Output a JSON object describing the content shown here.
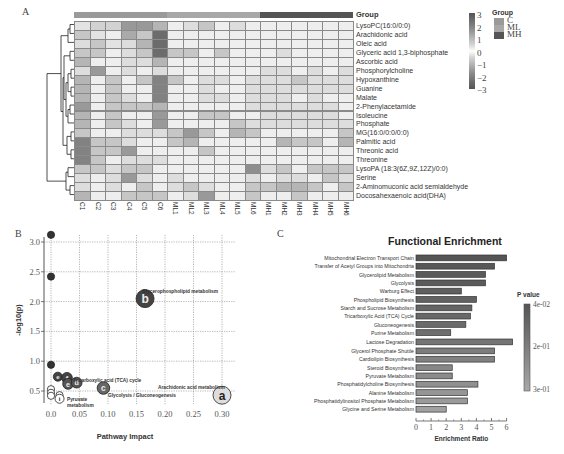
{
  "panels": {
    "a_label": "A",
    "b_label": "B",
    "c_label": "C"
  },
  "heatmap": {
    "group_header": "Group",
    "columns": [
      "C1",
      "C2",
      "C3",
      "C4",
      "C5",
      "C6",
      "ML1",
      "ML2",
      "ML3",
      "ML4",
      "ML5",
      "ML6",
      "MH1",
      "MH2",
      "MH3",
      "MH4",
      "MH5",
      "MH6"
    ],
    "column_groups": [
      "C",
      "C",
      "C",
      "C",
      "C",
      "C",
      "ML",
      "ML",
      "ML",
      "ML",
      "ML",
      "ML",
      "MH",
      "MH",
      "MH",
      "MH",
      "MH",
      "MH"
    ],
    "rows": [
      "LysoPC(16:0/0:0)",
      "Arachidonic acid",
      "Oleic acid",
      "Glyceric acid 1,3-biphosphate",
      "Ascorbic acid",
      "Phosphorylcholine",
      "Hypoxanthine",
      "Guanine",
      "Malate",
      "2-Phenylacetamide",
      "Isoleucine",
      "Phosphate",
      "MG(16:0/0:0/0:0)",
      "Palmitic acid",
      "Threonic acid",
      "Threonine",
      "LysoPA (18:3(6Z,9Z,12Z)/0:0)",
      "Serine",
      "2-Aminomuconic acid semialdehyde",
      "Docosahexaenoic acid(DHA)"
    ],
    "values": [
      [
        0.5,
        -0.8,
        -0.8,
        -1.8,
        -1.8,
        -1.3,
        0.3,
        -0.6,
        1.0,
        0.3,
        -0.6,
        0.3,
        0.3,
        0.3,
        0.3,
        0.3,
        0.3,
        0.3
      ],
      [
        1.0,
        0.5,
        -0.3,
        -1.5,
        -1.0,
        -2.6,
        0.3,
        0.3,
        0.3,
        0.3,
        0.3,
        0.3,
        0.3,
        0.3,
        0.3,
        0.3,
        0.3,
        0.3
      ],
      [
        -0.6,
        1.0,
        0.5,
        -0.6,
        -1.3,
        -2.6,
        0.3,
        0.3,
        0.3,
        0.3,
        0.3,
        0.3,
        0.3,
        0.3,
        0.3,
        0.3,
        0.3,
        0.3
      ],
      [
        -1.0,
        1.0,
        0.3,
        -0.6,
        -1.0,
        -2.6,
        1.0,
        1.0,
        0.3,
        1.0,
        0.3,
        0.3,
        0.3,
        -0.6,
        0.3,
        -0.3,
        0.3,
        0.3
      ],
      [
        -1.3,
        -0.3,
        0.3,
        -0.6,
        -0.6,
        -1.3,
        0.3,
        0.3,
        0.3,
        0.3,
        0.3,
        0.3,
        0.3,
        0.3,
        0.3,
        0.3,
        0.3,
        0.3
      ],
      [
        -0.6,
        -1.8,
        0.3,
        -0.6,
        0.3,
        -0.6,
        0.3,
        -0.3,
        0.3,
        0.3,
        -0.3,
        0.3,
        -0.6,
        -0.6,
        0.3,
        -0.6,
        -0.3,
        -0.6
      ],
      [
        -1.3,
        -0.3,
        1.0,
        -0.3,
        1.0,
        -2.2,
        1.0,
        -0.3,
        -0.6,
        -0.6,
        -0.3,
        -0.6,
        -0.6,
        -0.6,
        1.0,
        -0.6,
        -0.6,
        -0.6
      ],
      [
        -1.3,
        -0.3,
        1.0,
        -0.3,
        0.3,
        -2.2,
        0.3,
        -0.3,
        -0.6,
        0.3,
        0.3,
        -0.6,
        -0.6,
        -0.6,
        -0.6,
        -0.6,
        -0.6,
        -0.6
      ],
      [
        -1.3,
        -0.3,
        1.0,
        -0.6,
        0.3,
        -2.2,
        0.3,
        0.3,
        -0.6,
        -0.6,
        0.3,
        -0.6,
        -0.6,
        -0.6,
        0.3,
        -0.6,
        -0.3,
        -0.3
      ],
      [
        -1.8,
        0.3,
        1.0,
        -1.0,
        1.0,
        -1.3,
        0.3,
        0.3,
        0.3,
        0.3,
        0.3,
        -0.6,
        -0.6,
        -0.6,
        -0.6,
        -0.6,
        -0.6,
        0.3
      ],
      [
        -1.3,
        0.3,
        1.0,
        -0.3,
        0.3,
        -1.8,
        0.3,
        0.3,
        1.0,
        1.0,
        0.3,
        -0.3,
        -0.6,
        -0.6,
        -0.6,
        -0.6,
        -0.6,
        -0.3
      ],
      [
        -1.3,
        0.3,
        1.0,
        -0.6,
        -0.3,
        -1.8,
        0.3,
        0.3,
        0.3,
        0.3,
        1.0,
        -0.6,
        -0.6,
        -0.6,
        -0.6,
        -0.6,
        -0.6,
        -0.6
      ],
      [
        -1.0,
        0.3,
        0.3,
        -0.6,
        -0.6,
        -0.6,
        1.0,
        -1.8,
        1.0,
        0.3,
        -1.3,
        1.0,
        0.3,
        0.3,
        0.3,
        0.3,
        -0.3,
        1.0
      ],
      [
        -2.2,
        1.0,
        1.0,
        -0.6,
        0.3,
        -0.3,
        1.0,
        -1.3,
        0.3,
        0.3,
        0.3,
        0.3,
        -0.3,
        -1.3,
        1.0,
        1.0,
        0.3,
        -1.3
      ],
      [
        -2.2,
        1.0,
        1.0,
        -1.8,
        0.3,
        0.3,
        0.3,
        0.3,
        1.0,
        0.3,
        0.3,
        0.3,
        -0.3,
        0.3,
        0.3,
        0.3,
        0.3,
        0.3
      ],
      [
        -2.2,
        1.0,
        0.3,
        -0.6,
        -0.6,
        -0.6,
        0.3,
        0.3,
        0.3,
        0.3,
        0.3,
        0.3,
        0.3,
        0.3,
        0.3,
        -0.3,
        0.3,
        0.3
      ],
      [
        -1.0,
        1.0,
        -0.6,
        -1.0,
        -1.0,
        -0.3,
        0.3,
        0.3,
        0.3,
        0.3,
        0.3,
        -2.0,
        -0.6,
        -1.0,
        -0.3,
        1.0,
        1.0,
        -1.0
      ],
      [
        -0.6,
        0.3,
        -0.6,
        -1.8,
        -0.6,
        0.3,
        -0.6,
        0.3,
        0.3,
        0.3,
        0.3,
        -0.6,
        0.3,
        -0.6,
        -0.6,
        0.3,
        1.0,
        -0.6
      ],
      [
        -0.6,
        0.3,
        -0.6,
        -0.3,
        -1.0,
        0.3,
        -0.6,
        1.0,
        -0.6,
        0.3,
        0.3,
        1.0,
        1.0,
        -1.3,
        -1.3,
        1.0,
        0.3,
        1.0
      ],
      [
        -1.3,
        0.3,
        0.3,
        -1.0,
        -1.0,
        -1.0,
        0.3,
        -0.6,
        -1.8,
        0.3,
        0.3,
        1.0,
        0.3,
        0.3,
        1.0,
        0.3,
        0.3,
        0.3
      ]
    ],
    "colorbar": {
      "ticks": [
        "3",
        "2",
        "1",
        "0",
        "−1",
        "−2",
        "−3"
      ],
      "range": [
        -3,
        3
      ]
    },
    "group_legend": {
      "title": "Group",
      "items": [
        {
          "label": "C",
          "color": "#9a9a9a"
        },
        {
          "label": "ML",
          "color": "#a8a8a8"
        },
        {
          "label": "MH",
          "color": "#555555"
        }
      ]
    }
  },
  "chart_data": [
    {
      "type": "heatmap",
      "title": "",
      "x": [
        "C1",
        "C2",
        "C3",
        "C4",
        "C5",
        "C6",
        "ML1",
        "ML2",
        "ML3",
        "ML4",
        "ML5",
        "ML6",
        "MH1",
        "MH2",
        "MH3",
        "MH4",
        "MH5",
        "MH6"
      ],
      "y": [
        "LysoPC(16:0/0:0)",
        "Arachidonic acid",
        "Oleic acid",
        "Glyceric acid 1,3-biphosphate",
        "Ascorbic acid",
        "Phosphorylcholine",
        "Hypoxanthine",
        "Guanine",
        "Malate",
        "2-Phenylacetamide",
        "Isoleucine",
        "Phosphate",
        "MG(16:0/0:0/0:0)",
        "Palmitic acid",
        "Threonic acid",
        "Threonine",
        "LysoPA (18:3(6Z,9Z,12Z)/0:0)",
        "Serine",
        "2-Aminomuconic acid semialdehyde",
        "Docosahexaenoic acid(DHA)"
      ],
      "zrange": [
        -3,
        3
      ],
      "annotation": "Group: C, ML, MH",
      "dendrogram": "rows"
    },
    {
      "type": "scatter",
      "title": "",
      "xlabel": "Pathway Impact",
      "ylabel": "-log10(p)",
      "xlim": [
        0.0,
        0.3
      ],
      "ylim": [
        0.3,
        3.1
      ],
      "xticks": [
        "0.0",
        "0.05",
        "0.10",
        "0.15",
        "0.20",
        "0.25",
        "0.30"
      ],
      "yticks": [
        "0.5",
        "1.0",
        "1.5",
        "2.0",
        "2.5",
        "3.0"
      ],
      "grid": true,
      "points": [
        {
          "x": 0.0,
          "y": 3.12,
          "size": 4,
          "label": "",
          "fill": "#333333"
        },
        {
          "x": 0.0,
          "y": 2.42,
          "size": 4,
          "label": "",
          "fill": "#333333"
        },
        {
          "x": 0.0,
          "y": 0.94,
          "size": 4,
          "label": "",
          "fill": "#333333"
        },
        {
          "x": 0.165,
          "y": 2.05,
          "size": 10,
          "label": "b",
          "fill": "#444444"
        },
        {
          "x": 0.012,
          "y": 0.74,
          "size": 5,
          "label": "e",
          "fill": "#444444"
        },
        {
          "x": 0.028,
          "y": 0.72,
          "size": 6,
          "label": "f",
          "fill": "#444444"
        },
        {
          "x": 0.03,
          "y": 0.62,
          "size": 6,
          "label": "e",
          "fill": "#555555"
        },
        {
          "x": 0.045,
          "y": 0.64,
          "size": 6,
          "label": "d",
          "fill": "#555555"
        },
        {
          "x": 0.092,
          "y": 0.55,
          "size": 7,
          "label": "c",
          "fill": "#666666"
        },
        {
          "x": 0.3,
          "y": 0.43,
          "size": 10,
          "label": "a",
          "fill": "#dddddd"
        },
        {
          "x": 0.0,
          "y": 0.53,
          "size": 4,
          "label": "",
          "fill": "#ffffff"
        },
        {
          "x": 0.0,
          "y": 0.47,
          "size": 4,
          "label": "",
          "fill": "#ffffff"
        },
        {
          "x": 0.0,
          "y": 0.42,
          "size": 4,
          "label": "",
          "fill": "#ffffff"
        },
        {
          "x": 0.015,
          "y": 0.43,
          "size": 4,
          "label": "",
          "fill": "#ffffff"
        },
        {
          "x": 0.015,
          "y": 0.37,
          "size": 5,
          "label": "i",
          "fill": "#ffffff"
        }
      ],
      "annotations": [
        "Glycerophospholipid metabolism",
        "Tricarboxylic acid (TCA) cycle",
        "Arachidonic acid metabolism",
        "Glycolysis / Gluconeogenesis",
        "Pyruvate metabolism"
      ]
    },
    {
      "type": "bar",
      "orientation": "horizontal",
      "title": "Functional Enrichment",
      "xlabel": "Enrichment Ratio",
      "ylabel": "",
      "xlim": [
        0,
        6.3
      ],
      "xticks": [
        "0",
        "1",
        "2",
        "3",
        "4",
        "5",
        "6"
      ],
      "categories": [
        "Mitochondrial Electron Transport Chain",
        "Transfer of Acetyl Groups into Mitochondria",
        "Glycerolipid Metabolism",
        "Glycolysis",
        "Warburg Effect",
        "Phospholipid Biosynthesis",
        "Starch and Sucrose Metabolism",
        "Tricarboxylic Acid (TCA) Cycle",
        "Gluconeogenesis",
        "Purine Metabolism",
        "Lactose Degradation",
        "Glycerol Phosphate Shuttle",
        "Cardiolipin Biosynthesis",
        "Steroid Biosynthesis",
        "Pyruvate Metabolism",
        "Phosphatidylcholine Biosynthesis",
        "Alanine Metabolism",
        "Phosphatidylinositol Phosphate Metabolism",
        "Glycine and Serine Metabolism"
      ],
      "values": [
        6.0,
        5.2,
        4.6,
        4.6,
        3.0,
        4.0,
        3.7,
        3.6,
        3.3,
        2.3,
        6.4,
        5.2,
        5.2,
        2.4,
        2.4,
        4.1,
        3.4,
        3.4,
        2.0
      ],
      "pvalue_shade": [
        0.0,
        0.03,
        0.06,
        0.08,
        0.12,
        0.16,
        0.2,
        0.24,
        0.28,
        0.32,
        0.4,
        0.5,
        0.55,
        0.62,
        0.66,
        0.74,
        0.8,
        0.86,
        0.95
      ],
      "legend": {
        "title": "P value",
        "ticks": [
          "4e-02",
          "2e-01",
          "3e-01"
        ],
        "position": "right"
      }
    }
  ]
}
